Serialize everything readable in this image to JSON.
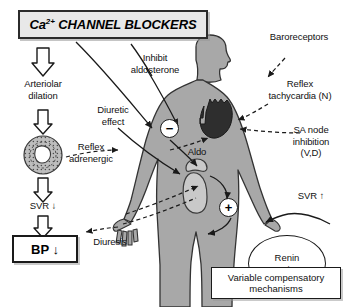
{
  "title": {
    "prefix": "Ca",
    "superscript": "2+",
    "rest": " CHANNEL BLOCKERS"
  },
  "left_pathway": {
    "arteriolar_dilation": "Arteriolar\ndilation",
    "vessel_icon": "blood-vessel-cross-section-icon",
    "svr_down": "SVR ↓",
    "bp_down": "BP ↓"
  },
  "center_labels": {
    "inhibit_aldosterone": "Inhibit\naldosterone",
    "diuretic_effect": "Diuretic\neffect",
    "reflex_adrenergic": "Reflex\nadrenergic",
    "diuresis": "Diuresis",
    "aldo": "Aldo"
  },
  "right_labels": {
    "baroreceptors": "Baroreceptors",
    "reflex_tachycardia": "Reflex\ntachycardia (N)",
    "sa_node_inhibition": "SA node\ninhibition\n(V,D)",
    "svr_up": "SVR ↑"
  },
  "badges": {
    "minus": "−",
    "plus": "+"
  },
  "renin": "Renin\nAngio-II",
  "compensatory_box": "Variable compensatory\nmechanisms",
  "colors": {
    "body_fill": "#a8a8a8",
    "body_stroke": "#333333",
    "heart_fill": "#2e2e2e",
    "organ_fill": "#c9c9c9",
    "title_fill": "#e8e8e8",
    "line": "#1a1a1a"
  }
}
